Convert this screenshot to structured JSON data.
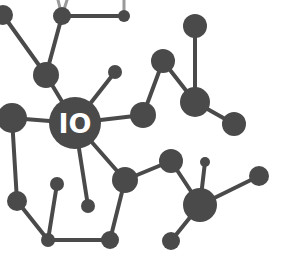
{
  "diagram": {
    "type": "network-graph",
    "colors": {
      "node": "#4a4a4a",
      "edge": "#4a4a4a",
      "background": "#ffffff",
      "label": "#ffffff"
    },
    "center_label": "IO",
    "nodes": [
      {
        "id": "n0",
        "x": 3,
        "y": 15,
        "r": 10
      },
      {
        "id": "n1",
        "x": 62,
        "y": 16,
        "r": 9
      },
      {
        "id": "n2",
        "x": 124,
        "y": 16,
        "r": 6
      },
      {
        "id": "n3",
        "x": 46,
        "y": 75,
        "r": 13
      },
      {
        "id": "n4",
        "x": 115,
        "y": 72,
        "r": 7
      },
      {
        "id": "n5",
        "x": 195,
        "y": 26,
        "r": 12
      },
      {
        "id": "n6",
        "x": 163,
        "y": 61,
        "r": 12
      },
      {
        "id": "n7",
        "x": 195,
        "y": 102,
        "r": 15
      },
      {
        "id": "n8",
        "x": 234,
        "y": 124,
        "r": 12
      },
      {
        "id": "n9",
        "x": 143,
        "y": 115,
        "r": 13
      },
      {
        "id": "center",
        "x": 75,
        "y": 123,
        "r": 26
      },
      {
        "id": "n11",
        "x": 12,
        "y": 118,
        "r": 15
      },
      {
        "id": "n12",
        "x": 125,
        "y": 180,
        "r": 13
      },
      {
        "id": "n13",
        "x": 171,
        "y": 161,
        "r": 12
      },
      {
        "id": "n14",
        "x": 205,
        "y": 162,
        "r": 5
      },
      {
        "id": "n15",
        "x": 200,
        "y": 205,
        "r": 17
      },
      {
        "id": "n16",
        "x": 259,
        "y": 176,
        "r": 10
      },
      {
        "id": "n17",
        "x": 171,
        "y": 241,
        "r": 9
      },
      {
        "id": "n18",
        "x": 17,
        "y": 201,
        "r": 10
      },
      {
        "id": "n19",
        "x": 57,
        "y": 184,
        "r": 7
      },
      {
        "id": "n20",
        "x": 88,
        "y": 206,
        "r": 7
      },
      {
        "id": "n21",
        "x": 48,
        "y": 240,
        "r": 7
      },
      {
        "id": "n22",
        "x": 110,
        "y": 240,
        "r": 9
      }
    ]
  }
}
